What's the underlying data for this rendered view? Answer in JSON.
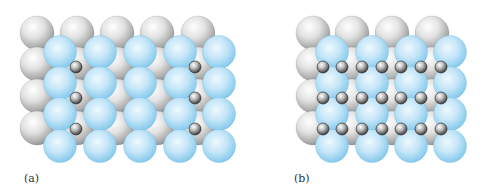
{
  "figure": {
    "panels": [
      {
        "id": "a",
        "label": "(a)",
        "description": "Close-packed layers with interstitial atoms occupying some sites",
        "gray_spheres": {
          "xs": [
            37,
            77,
            117,
            157,
            198
          ],
          "ys": [
            33,
            64,
            96,
            128
          ],
          "r": 17
        },
        "blue_spheres": {
          "xs": [
            60,
            100,
            140,
            180,
            219
          ],
          "ys": [
            52,
            83,
            114,
            146
          ],
          "r": 16.5
        },
        "small_spheres": {
          "points": [
            [
              76,
              67
            ],
            [
              195,
              67
            ],
            [
              76,
              98
            ],
            [
              195,
              98
            ],
            [
              76,
              129
            ],
            [
              195,
              129
            ]
          ],
          "r": 6
        }
      },
      {
        "id": "b",
        "label": "(b)",
        "description": "Close-packed layers with interstitial atoms filling all sites",
        "gray_spheres": {
          "xs": [
            313,
            352,
            392,
            432
          ],
          "ys": [
            33,
            64,
            96,
            128
          ],
          "r": 17
        },
        "blue_spheres": {
          "xs": [
            332,
            372,
            411,
            450
          ],
          "ys": [
            52,
            83,
            114,
            146
          ],
          "r": 16.5
        },
        "small_spheres": {
          "xs": [
            323,
            342,
            362,
            382,
            401,
            421,
            441
          ],
          "ys": [
            67,
            98,
            129
          ],
          "r": 6
        }
      }
    ],
    "colors": {
      "gray_light": "#f4f4f4",
      "gray_dark": "#8e8e8e",
      "blue_light": "#e6f4fc",
      "blue_dark": "#72bfe6",
      "small_light": "#f0f0f0",
      "small_dark": "#3a3a3a"
    }
  }
}
